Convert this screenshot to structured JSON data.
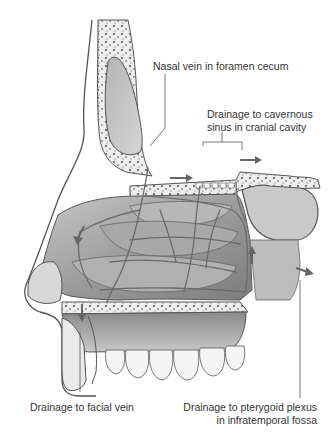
{
  "figure": {
    "colors": {
      "background": "#ffffff",
      "outline": "#555555",
      "bone": "#f2f2f2",
      "mucosa": "#9a9a9a",
      "vein": "#6e6e6e",
      "arrow": "#666666",
      "text": "#333333"
    }
  },
  "labels": {
    "nasal_vein": "Nasal vein in foramen cecum",
    "cavernous_line1": "Drainage to cavernous",
    "cavernous_line2": "sinus in cranial cavity",
    "facial_vein": "Drainage to facial vein",
    "pterygoid_line1": "Drainage to pterygoid plexus",
    "pterygoid_line2": "in infratemporal fossa"
  }
}
